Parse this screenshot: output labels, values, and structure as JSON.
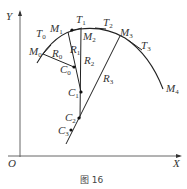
{
  "figure": {
    "caption": "图 16",
    "axes": {
      "x_label": "X",
      "y_label": "Y",
      "origin_label": "O"
    },
    "curve_points": [
      {
        "name": "M",
        "sub": "0"
      },
      {
        "name": "M",
        "sub": "1"
      },
      {
        "name": "M",
        "sub": "2"
      },
      {
        "name": "M",
        "sub": "3"
      },
      {
        "name": "M",
        "sub": "4"
      }
    ],
    "tangents": [
      {
        "name": "T",
        "sub": "0"
      },
      {
        "name": "T",
        "sub": "1"
      },
      {
        "name": "T",
        "sub": "2"
      },
      {
        "name": "T",
        "sub": "3"
      }
    ],
    "centers": [
      {
        "name": "C",
        "sub": "0"
      },
      {
        "name": "C",
        "sub": "1"
      },
      {
        "name": "C",
        "sub": "2"
      },
      {
        "name": "C",
        "sub": "3"
      }
    ],
    "radii": [
      {
        "name": "R",
        "sub": "0"
      },
      {
        "name": "R",
        "sub": "1"
      },
      {
        "name": "R",
        "sub": "2"
      },
      {
        "name": "R",
        "sub": "3"
      }
    ]
  }
}
